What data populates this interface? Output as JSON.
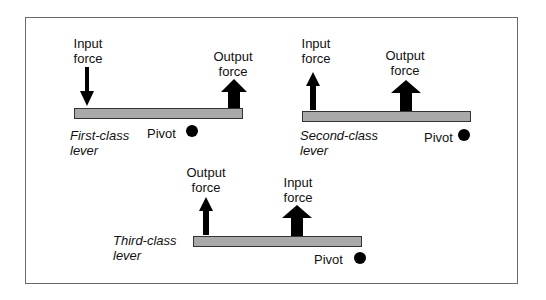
{
  "diagram": {
    "type": "lever-classes",
    "colors": {
      "beam": "#a9a9a9",
      "arrow": "#000000",
      "pivot": "#000000",
      "frame": "#6a6a6a"
    },
    "levers": [
      {
        "name": "First-class lever",
        "class_line1": "First-class",
        "class_line2": "lever",
        "input": {
          "line1": "Input",
          "line2": "force",
          "direction": "down",
          "weight": "thin"
        },
        "output": {
          "line1": "Output",
          "line2": "force",
          "direction": "up",
          "weight": "thick"
        },
        "pivot": {
          "label": "Pivot",
          "icon": "pivot-dot-icon"
        }
      },
      {
        "name": "Second-class lever",
        "class_line1": "Second-class",
        "class_line2": "lever",
        "input": {
          "line1": "Input",
          "line2": "force",
          "direction": "up",
          "weight": "thin"
        },
        "output": {
          "line1": "Output",
          "line2": "force",
          "direction": "up",
          "weight": "thick"
        },
        "pivot": {
          "label": "Pivot",
          "icon": "pivot-dot-icon"
        }
      },
      {
        "name": "Third-class lever",
        "class_line1": "Third-class",
        "class_line2": "lever",
        "output": {
          "line1": "Output",
          "line2": "force",
          "direction": "up",
          "weight": "thin"
        },
        "input": {
          "line1": "Input",
          "line2": "force",
          "direction": "up",
          "weight": "thick"
        },
        "pivot": {
          "label": "Pivot",
          "icon": "pivot-dot-icon"
        }
      }
    ]
  }
}
